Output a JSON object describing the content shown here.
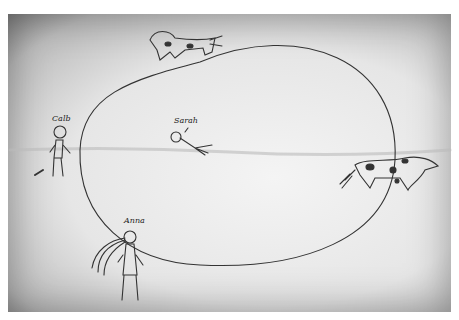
{
  "image": {
    "type": "scanned child's pencil drawing",
    "labels": {
      "left_figure": "Calb",
      "center_figure": "Sarah",
      "bottom_figure": "Anna"
    },
    "elements": [
      "large oval loop",
      "spotted dog at top of oval",
      "spotted dog at right of oval",
      "standing figure Calb at left",
      "lying figure Sarah in center",
      "figure Anna at bottom with lines from face"
    ]
  }
}
